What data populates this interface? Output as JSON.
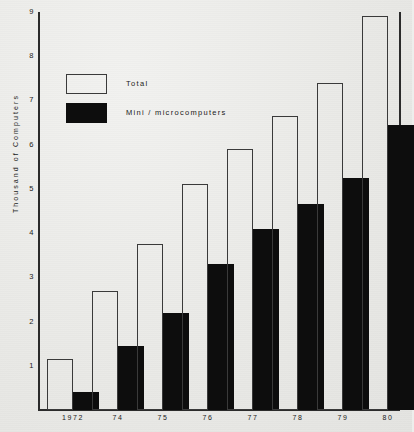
{
  "chart_data": {
    "type": "bar",
    "title": "",
    "subtitle": "",
    "xlabel": "",
    "ylabel": "Thousand of Computers",
    "categories": [
      "1972",
      "74",
      "75",
      "76",
      "77",
      "78",
      "79",
      "80"
    ],
    "series": [
      {
        "name": "Total",
        "style": "outline",
        "color": "#3a3a3a",
        "values": [
          1.15,
          2.7,
          3.75,
          5.1,
          5.9,
          6.65,
          7.4,
          8.9
        ]
      },
      {
        "name": "Mini / microcomputers",
        "style": "filled",
        "color": "#0d0d0d",
        "values": [
          0.4,
          1.45,
          2.2,
          3.3,
          4.1,
          4.65,
          5.25,
          6.45
        ]
      }
    ],
    "ylim": [
      0,
      9
    ],
    "yticks": [
      "1",
      "2",
      "3",
      "4",
      "5",
      "6",
      "7",
      "8",
      "9"
    ],
    "grid": false,
    "legend_position": "upper-left-inside"
  },
  "legend": {
    "items": [
      {
        "label": "Total",
        "swatch": "outline-box-icon"
      },
      {
        "label": "Mini / microcomputers",
        "swatch": "filled-box-icon"
      }
    ]
  },
  "colors": {
    "background": "#eeeeec",
    "axis": "#2b2b2b",
    "text": "#1a1a1a",
    "bar_fill": "#0d0d0d",
    "bar_outline": "#3a3a3a"
  }
}
